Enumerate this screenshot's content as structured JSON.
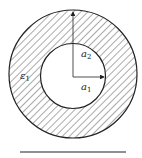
{
  "diagram": {
    "type": "coaxial-annulus-cross-section",
    "labels": {
      "outer_radius": {
        "base": "a",
        "sub": "2"
      },
      "inner_radius": {
        "base": "a",
        "sub": "1"
      },
      "permittivity": {
        "base": "ε",
        "sub": "1"
      }
    },
    "colors": {
      "stroke": "#222222",
      "hatch": "#555555",
      "background": "#ffffff"
    }
  }
}
